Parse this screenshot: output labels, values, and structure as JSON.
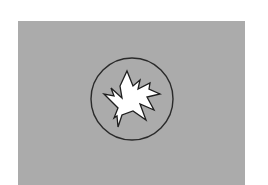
{
  "figure": {
    "background_color": "#ffffff",
    "panel_color": "#ababab",
    "circle": {
      "cx": 132,
      "cy": 99,
      "r": 41,
      "stroke": "#2a2a2a"
    },
    "starburst": {
      "fill": "#ffffff",
      "stroke": "#1e1e1e",
      "icon": "fracture-starburst-icon"
    }
  }
}
